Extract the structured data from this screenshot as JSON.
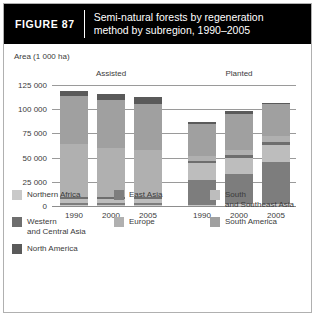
{
  "figure": {
    "number_label": "FIGURE 87",
    "title_line1": "Semi-natural forests by regeneration",
    "title_line2": "method by subregion, 1990–2005"
  },
  "chart_data": {
    "type": "bar",
    "subtype": "stacked",
    "title": "Semi-natural forests by regeneration method by subregion, 1990–2005",
    "xlabel": "",
    "ylabel": "Area (1 000 ha)",
    "ylim": [
      0,
      125000
    ],
    "yticks": [
      0,
      25000,
      50000,
      75000,
      100000,
      125000
    ],
    "ytick_labels": [
      "0",
      "25 000",
      "50 000",
      "75 000",
      "100 000",
      "125 000"
    ],
    "grid": true,
    "legend_position": "bottom",
    "group_labels": [
      "Assisted",
      "Planted"
    ],
    "categories": [
      "1990",
      "2000",
      "2005",
      "1990",
      "2000",
      "2005"
    ],
    "groups": [
      "Assisted",
      "Assisted",
      "Assisted",
      "Planted",
      "Planted",
      "Planted"
    ],
    "series": [
      {
        "name": "Northern Africa",
        "color": "#c9c9c9",
        "values": [
          1000,
          1000,
          1000,
          1500,
          1800,
          2000
        ]
      },
      {
        "name": "East Asia",
        "color": "#7d7d7d",
        "values": [
          2000,
          2000,
          2000,
          25000,
          31000,
          43000
        ]
      },
      {
        "name": "South and Southeast Asia",
        "color": "#bdbdbd",
        "values": [
          4000,
          4000,
          4000,
          18000,
          17000,
          18000
        ]
      },
      {
        "name": "Western and Central Asia",
        "color": "#6e6e6e",
        "values": [
          2500,
          2500,
          2500,
          2000,
          2500,
          3000
        ]
      },
      {
        "name": "Europe",
        "color": "#b0b0b0",
        "values": [
          55000,
          51000,
          48000,
          5000,
          5500,
          6000
        ]
      },
      {
        "name": "South America",
        "color": "#a0a0a0",
        "values": [
          49000,
          49000,
          48000,
          33000,
          37000,
          33000
        ]
      },
      {
        "name": "North America",
        "color": "#5a5a5a",
        "values": [
          5500,
          6500,
          7500,
          2500,
          3200,
          2000
        ]
      }
    ],
    "totals": [
      119000,
      116000,
      113000,
      87000,
      98000,
      107000
    ]
  },
  "legend": {
    "items": [
      {
        "label": "Northern Africa",
        "label2": "",
        "color": "#c9c9c9"
      },
      {
        "label": "East Asia",
        "label2": "",
        "color": "#7d7d7d"
      },
      {
        "label": "South",
        "label2": "and Southeast Asia",
        "color": "#bdbdbd"
      },
      {
        "label": "Western",
        "label2": "and Central Asia",
        "color": "#6e6e6e"
      },
      {
        "label": "Europe",
        "label2": "",
        "color": "#b0b0b0"
      },
      {
        "label": "South America",
        "label2": "",
        "color": "#a0a0a0"
      },
      {
        "label": "North America",
        "label2": "",
        "color": "#5a5a5a"
      }
    ]
  }
}
